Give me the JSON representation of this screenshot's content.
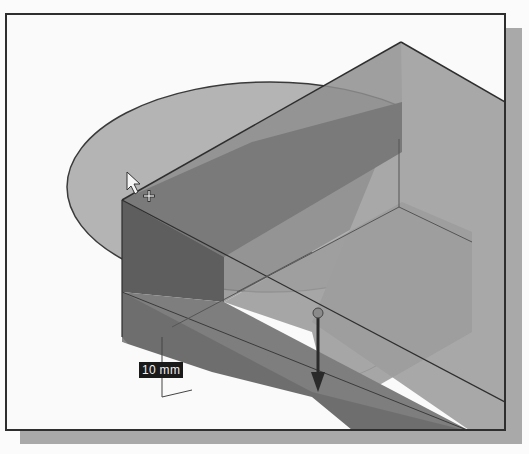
{
  "viewport": {
    "dimension_label": "10 mm",
    "colors": {
      "background": "#fafafa",
      "block_top": "#a4a4a4",
      "block_front": "#6e6e6e",
      "block_dark_face": "#555555",
      "cylinder_top": "#b8b8b8",
      "edge": "#3a3a3a",
      "frame": "#2e2e2e",
      "shadow": "#a9a9a9"
    }
  },
  "icons": {
    "cursor": "arrow-cursor-icon",
    "crosshair": "crosshair-icon",
    "drag_handle": "sphere-handle-icon",
    "direction_arrow": "arrow-down-icon"
  }
}
